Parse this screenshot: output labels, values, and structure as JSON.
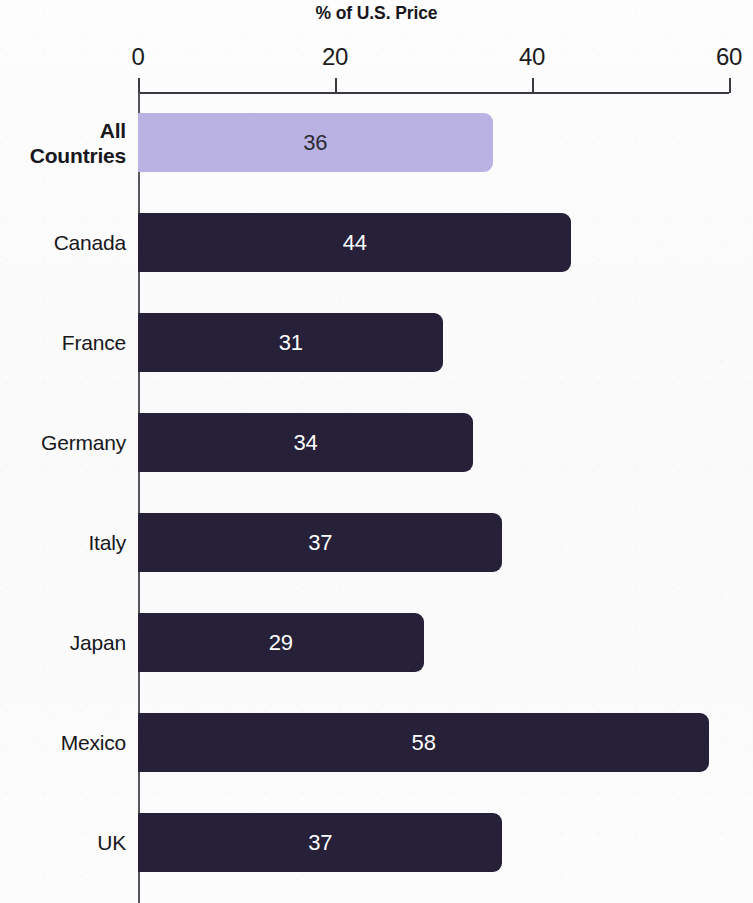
{
  "chart_data": {
    "type": "bar",
    "orientation": "horizontal",
    "title": "% of U.S. Price",
    "xlabel": "",
    "ylabel": "",
    "xlim": [
      0,
      60
    ],
    "xticks": [
      0,
      20,
      40,
      60
    ],
    "xtick_labels": [
      "0",
      "20",
      "40",
      "60"
    ],
    "grid": false,
    "legend": false,
    "categories": [
      "All Countries",
      "Canada",
      "France",
      "Germany",
      "Italy",
      "Japan",
      "Mexico",
      "UK"
    ],
    "values": [
      36,
      44,
      31,
      34,
      37,
      29,
      58,
      37
    ],
    "value_labels": [
      "36",
      "44",
      "31",
      "34",
      "37",
      "29",
      "58",
      "37"
    ],
    "bar_colors": [
      "#b9b2e3",
      "#262039",
      "#262039",
      "#262039",
      "#262039",
      "#262039",
      "#262039",
      "#262039"
    ],
    "value_label_colors": [
      "#2b2b33",
      "#ffffff",
      "#ffffff",
      "#ffffff",
      "#ffffff",
      "#ffffff",
      "#ffffff",
      "#ffffff"
    ],
    "highlight_category": "All Countries",
    "highlight_color": "#b9b2e3",
    "bar_color": "#262039",
    "background_color": "#fcfcfc",
    "axis_color": "#3a3a42"
  },
  "category_lines": [
    [
      "All",
      "Countries"
    ],
    [
      "Canada"
    ],
    [
      "France"
    ],
    [
      "Germany"
    ],
    [
      "Italy"
    ],
    [
      "Japan"
    ],
    [
      "Mexico"
    ],
    [
      "UK"
    ]
  ]
}
